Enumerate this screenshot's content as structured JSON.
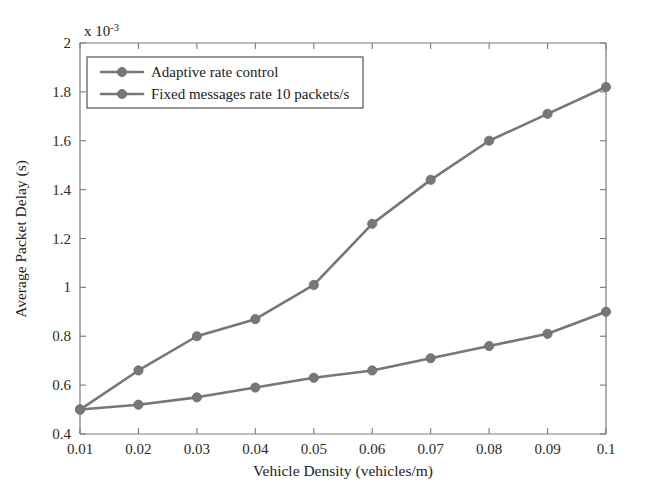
{
  "chart_data": {
    "type": "line",
    "title": "",
    "xlabel": "Vehicle Density (vehicles/m)",
    "ylabel": "Average Packet Delay (s)",
    "y_multiplier": "x 10",
    "y_multiplier_exponent": "-3",
    "x": [
      0.01,
      0.02,
      0.03,
      0.04,
      0.05,
      0.06,
      0.07,
      0.08,
      0.09,
      0.1
    ],
    "xlim": [
      0.01,
      0.1
    ],
    "ylim": [
      0.4,
      2
    ],
    "xticks": [
      "0.01",
      "0.02",
      "0.03",
      "0.04",
      "0.05",
      "0.06",
      "0.07",
      "0.08",
      "0.09",
      "0.1"
    ],
    "yticks": [
      "0.4",
      "0.6",
      "0.8",
      "1",
      "1.2",
      "1.4",
      "1.6",
      "1.8",
      "2"
    ],
    "grid": false,
    "legend_position": "top-left-inside",
    "series": [
      {
        "name": "Adaptive rate control",
        "color": "#777777",
        "marker": "circle",
        "values": [
          0.5,
          0.52,
          0.55,
          0.59,
          0.63,
          0.66,
          0.71,
          0.76,
          0.81,
          0.9
        ]
      },
      {
        "name": "Fixed messages rate 10 packets/s",
        "color": "#777777",
        "marker": "circle",
        "values": [
          0.5,
          0.66,
          0.8,
          0.87,
          1.01,
          1.26,
          1.44,
          1.6,
          1.71,
          1.82
        ]
      }
    ]
  }
}
